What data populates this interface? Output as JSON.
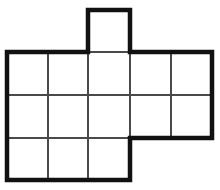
{
  "figure": {
    "title": "Cube net polyomino figure",
    "background_color": "#ffffff",
    "outline_color": "#111111",
    "interior_line_color": "#4a4a4a",
    "cell_fill_color": "#ffffff",
    "outline_stroke_width": 4.5,
    "interior_stroke_width": 2,
    "cell_width": 41,
    "cell_height": 43,
    "columns": 5,
    "rows": 3,
    "total_cells": 14,
    "grid_x_positions": [
      7,
      48,
      88,
      130,
      171,
      212
    ],
    "grid_y_positions": [
      52,
      95,
      138,
      180
    ],
    "cells": [
      {
        "name": "tab-cell",
        "col": 2,
        "row": -1,
        "x": 88,
        "y": 10,
        "w": 42,
        "h": 42
      },
      {
        "name": "cell-r1c1",
        "col": 0,
        "row": 0,
        "x": 7,
        "y": 52,
        "w": 41,
        "h": 43
      },
      {
        "name": "cell-r1c2",
        "col": 1,
        "row": 0,
        "x": 48,
        "y": 52,
        "w": 40,
        "h": 43
      },
      {
        "name": "cell-r1c3",
        "col": 2,
        "row": 0,
        "x": 88,
        "y": 52,
        "w": 42,
        "h": 43
      },
      {
        "name": "cell-r1c4",
        "col": 3,
        "row": 0,
        "x": 130,
        "y": 52,
        "w": 41,
        "h": 43
      },
      {
        "name": "cell-r1c5",
        "col": 4,
        "row": 0,
        "x": 171,
        "y": 52,
        "w": 41,
        "h": 43
      },
      {
        "name": "cell-r2c1",
        "col": 0,
        "row": 1,
        "x": 7,
        "y": 95,
        "w": 41,
        "h": 43
      },
      {
        "name": "cell-r2c2",
        "col": 1,
        "row": 1,
        "x": 48,
        "y": 95,
        "w": 40,
        "h": 43
      },
      {
        "name": "cell-r2c3",
        "col": 2,
        "row": 1,
        "x": 88,
        "y": 95,
        "w": 42,
        "h": 43
      },
      {
        "name": "cell-r2c4",
        "col": 3,
        "row": 1,
        "x": 130,
        "y": 95,
        "w": 41,
        "h": 43
      },
      {
        "name": "cell-r2c5",
        "col": 4,
        "row": 1,
        "x": 171,
        "y": 95,
        "w": 41,
        "h": 43
      },
      {
        "name": "cell-r3c1",
        "col": 0,
        "row": 2,
        "x": 7,
        "y": 138,
        "w": 41,
        "h": 42
      },
      {
        "name": "cell-r3c2",
        "col": 1,
        "row": 2,
        "x": 48,
        "y": 138,
        "w": 40,
        "h": 42
      },
      {
        "name": "cell-r3c3",
        "col": 2,
        "row": 2,
        "x": 88,
        "y": 138,
        "w": 42,
        "h": 42
      }
    ],
    "outline_path": "M 88 10 L 130 10 L 130 52 L 212 52 L 212 138 L 130 138 L 130 180 L 7 180 L 7 52 L 88 52 Z",
    "interior_lines": [
      {
        "name": "v-line-x48-row1to3",
        "x1": 48,
        "y1": 52,
        "x2": 48,
        "y2": 180
      },
      {
        "name": "v-line-x88-row1to3",
        "x1": 88,
        "y1": 52,
        "x2": 88,
        "y2": 180
      },
      {
        "name": "v-line-x130-row1to2",
        "x1": 130,
        "y1": 52,
        "x2": 130,
        "y2": 138
      },
      {
        "name": "v-line-x171-row1to2",
        "x1": 171,
        "y1": 52,
        "x2": 171,
        "y2": 138
      },
      {
        "name": "h-line-y95-full",
        "x1": 7,
        "y1": 95,
        "x2": 212,
        "y2": 95
      },
      {
        "name": "h-line-y138-left",
        "x1": 7,
        "y1": 138,
        "x2": 130,
        "y2": 138
      },
      {
        "name": "h-line-y52-tab-base",
        "x1": 88,
        "y1": 52,
        "x2": 130,
        "y2": 52
      }
    ]
  }
}
